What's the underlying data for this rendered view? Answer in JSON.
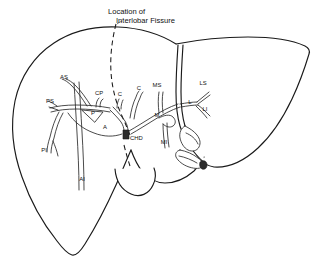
{
  "figure": {
    "kind": "anatomical-line-drawing",
    "background_color": "#ffffff",
    "line_color": "#1a1a1a"
  },
  "caption": {
    "line1": "Location of",
    "line2": "Interlobar Fissure"
  },
  "annotations": {
    "fissure": {
      "name": "interlobar-fissure",
      "style": "dashed"
    }
  },
  "labels": [
    {
      "id": "AS",
      "text": "AS",
      "x": 64,
      "y": 79,
      "anchor": "middle",
      "meaning": "anterior-superior-segmental-duct"
    },
    {
      "id": "CP",
      "text": "CP",
      "x": 99,
      "y": 95,
      "anchor": "middle",
      "meaning": "cystic-duct-posterior"
    },
    {
      "id": "C1",
      "text": "C",
      "x": 120,
      "y": 96,
      "anchor": "middle",
      "meaning": "cystic-duct"
    },
    {
      "id": "C2",
      "text": "C",
      "x": 139,
      "y": 90,
      "anchor": "middle",
      "meaning": "cystic-duct-branch"
    },
    {
      "id": "PS",
      "text": "PS",
      "x": 50,
      "y": 103,
      "anchor": "middle",
      "meaning": "posterior-superior-segmental-duct"
    },
    {
      "id": "P",
      "text": "P",
      "x": 93,
      "y": 115,
      "anchor": "middle",
      "meaning": "posterior-segmental-duct"
    },
    {
      "id": "A",
      "text": "A",
      "x": 105,
      "y": 129,
      "anchor": "middle",
      "meaning": "anterior-segmental-duct"
    },
    {
      "id": "PI",
      "text": "PI",
      "x": 44,
      "y": 152,
      "anchor": "middle",
      "meaning": "posterior-inferior-segmental-duct"
    },
    {
      "id": "AI",
      "text": "AI",
      "x": 82,
      "y": 181,
      "anchor": "middle",
      "meaning": "anterior-inferior-segmental-duct"
    },
    {
      "id": "CHD",
      "text": "CHD",
      "x": 130,
      "y": 140,
      "anchor": "start",
      "meaning": "common-hepatic-duct"
    },
    {
      "id": "MS",
      "text": "MS",
      "x": 157,
      "y": 87,
      "anchor": "middle",
      "meaning": "medial-superior-segmental-duct"
    },
    {
      "id": "M",
      "text": "M",
      "x": 157,
      "y": 117,
      "anchor": "middle",
      "meaning": "medial-segmental-duct"
    },
    {
      "id": "MI",
      "text": "MI",
      "x": 164,
      "y": 144,
      "anchor": "middle",
      "meaning": "medial-inferior-segmental-duct"
    },
    {
      "id": "LS",
      "text": "LS",
      "x": 203,
      "y": 85,
      "anchor": "middle",
      "meaning": "lateral-superior-segmental-duct"
    },
    {
      "id": "L",
      "text": "L",
      "x": 190,
      "y": 104,
      "anchor": "middle",
      "meaning": "lateral-segmental-duct"
    },
    {
      "id": "LI",
      "text": "LI",
      "x": 205,
      "y": 111,
      "anchor": "middle",
      "meaning": "lateral-inferior-segmental-duct"
    }
  ]
}
